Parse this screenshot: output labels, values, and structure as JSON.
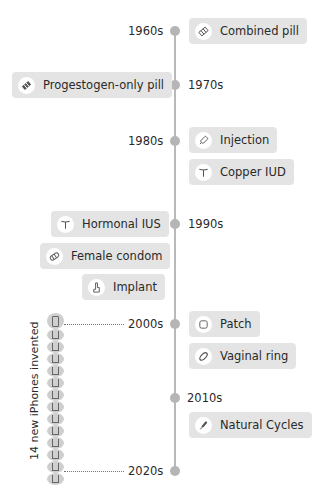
{
  "timeline": {
    "decades": [
      {
        "label": "1960s",
        "side": "left"
      },
      {
        "label": "1970s",
        "side": "right"
      },
      {
        "label": "1980s",
        "side": "left"
      },
      {
        "label": "1990s",
        "side": "right"
      },
      {
        "label": "2000s",
        "side": "left"
      },
      {
        "label": "2010s",
        "side": "right"
      },
      {
        "label": "2020s",
        "side": "left"
      }
    ],
    "methods": [
      {
        "label": "Combined pill",
        "icon": "pill-pack-icon",
        "decade": "1960s"
      },
      {
        "label": "Progestogen-only pill",
        "icon": "pill-pack-icon",
        "decade": "1970s"
      },
      {
        "label": "Injection",
        "icon": "syringe-icon",
        "decade": "1980s"
      },
      {
        "label": "Copper IUD",
        "icon": "iud-icon",
        "decade": "1980s"
      },
      {
        "label": "Hormonal IUS",
        "icon": "iud-icon",
        "decade": "1990s"
      },
      {
        "label": "Female condom",
        "icon": "condom-icon",
        "decade": "1990s"
      },
      {
        "label": "Implant",
        "icon": "implant-arm-icon",
        "decade": "1990s"
      },
      {
        "label": "Patch",
        "icon": "patch-icon",
        "decade": "2000s"
      },
      {
        "label": "Vaginal ring",
        "icon": "ring-icon",
        "decade": "2000s"
      },
      {
        "label": "Natural Cycles",
        "icon": "thermometer-icon",
        "decade": "2010s"
      }
    ]
  },
  "iphones": {
    "label": "14 new iPhones invented",
    "count": 14
  },
  "colors": {
    "card_bg": "#e4e4e4",
    "axis": "#b9b9b9",
    "dot": "#b5b5b5"
  }
}
